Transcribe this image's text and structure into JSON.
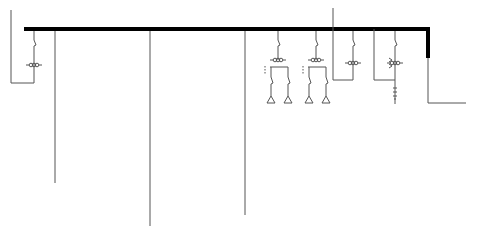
{
  "diagram": {
    "type": "single-line-electrical-diagram",
    "colors": {
      "bus": "#000000",
      "line": "#555555",
      "symbol": "#444444",
      "background": "#ffffff"
    },
    "bus": {
      "x1": 24,
      "x2": 428,
      "y": 29,
      "thickness": 4,
      "drop_to_y": 58
    },
    "feeders": [
      {
        "id": "feeder-1",
        "x": 34,
        "has_switch": true,
        "has_ct": true,
        "return_loop": {
          "left_x": 11,
          "top_y": 10,
          "bottom_y": 83
        }
      },
      {
        "id": "feeder-2",
        "x": 55,
        "end_y": 183
      },
      {
        "id": "feeder-3",
        "x": 150,
        "end_y": 226
      },
      {
        "id": "feeder-4",
        "x": 245,
        "end_y": 215
      },
      {
        "id": "feeder-5",
        "x": 278,
        "has_switch": true,
        "has_ct": true,
        "branches": 2,
        "loads": [
          "triangle",
          "triangle"
        ]
      },
      {
        "id": "feeder-6",
        "x": 316,
        "has_switch": true,
        "has_ct": true,
        "branches": 2,
        "loads": [
          "triangle",
          "triangle"
        ]
      },
      {
        "id": "feeder-7",
        "x": 353,
        "has_switch": true,
        "has_ct": true,
        "return_loop": {
          "left_x": 333,
          "top_y": 8,
          "bottom_y": 80
        }
      },
      {
        "id": "feeder-8",
        "x": 395,
        "has_switch": true,
        "has_ct": true,
        "has_arrester": true,
        "return_loop": {
          "left_x": 374,
          "bottom_y": 80
        }
      },
      {
        "id": "feeder-9",
        "x": 428,
        "end_y": 103,
        "turn_to_x": 466
      }
    ]
  }
}
